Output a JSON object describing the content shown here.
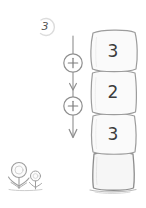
{
  "canvas": {
    "width": 146,
    "height": 208,
    "background": "#ffffff"
  },
  "target": {
    "name": "target-number",
    "value": "3",
    "badge_shape": "circle-outline",
    "badge_color": "#d9d9d9",
    "text_color": "#555555"
  },
  "operator_chain": {
    "name": "operator-chain",
    "arrow_color": "#8a8a8a",
    "operators": [
      {
        "symbol": "+",
        "label": "plus"
      },
      {
        "symbol": "+",
        "label": "plus"
      }
    ]
  },
  "block_stack": {
    "name": "block-stack",
    "outline_color": "#9a9a9a",
    "fill_color": "#f7f7f7",
    "blocks": [
      {
        "value": "3",
        "empty": false
      },
      {
        "value": "2",
        "empty": false
      },
      {
        "value": "3",
        "empty": false
      },
      {
        "value": "",
        "empty": true
      }
    ]
  },
  "decoration": {
    "flowers": {
      "name": "flowers-decoration",
      "color": "#9b9b9b",
      "count": 2
    },
    "ground": {
      "name": "ground-shadow",
      "color": "#b5b5b5"
    }
  }
}
